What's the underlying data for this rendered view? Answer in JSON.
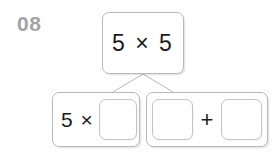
{
  "worksheet": {
    "problem_number": "08",
    "top_card": {
      "expression": "5 × 5"
    },
    "bottom_left_card": {
      "prefix": "5 ×",
      "blank_value": ""
    },
    "bottom_right_card": {
      "blank1_value": "",
      "operator": "+",
      "blank2_value": ""
    },
    "colors": {
      "number_gray": "#a3a3a3",
      "box_border": "#b9b9b9",
      "blank_border": "#c4c4c4",
      "text": "#1c1c1c",
      "background": "#ffffff",
      "connector_line": "#b9b9b9"
    }
  }
}
